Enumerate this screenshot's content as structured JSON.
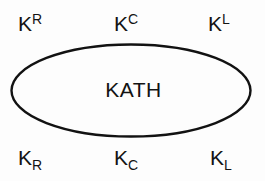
{
  "figure": {
    "name": "kath-ellipse-diagram",
    "background_color": "#fdfdfd",
    "stroke_color": "#121212",
    "text_color": "#131313",
    "center_label": "KATH",
    "ellipse": {
      "cx": 131,
      "cy": 90.5,
      "rx": 120,
      "ry": 46.5,
      "stroke_width": 2.4
    },
    "labels": {
      "top_left": {
        "base": "K",
        "sup": "R"
      },
      "top_center": {
        "base": "K",
        "sup": "C"
      },
      "top_right": {
        "base": "K",
        "sup": "L"
      },
      "bottom_left": {
        "base": "K",
        "sub": "R"
      },
      "bottom_center": {
        "base": "K",
        "sub": "C"
      },
      "bottom_right": {
        "base": "K",
        "sub": "L"
      }
    }
  }
}
